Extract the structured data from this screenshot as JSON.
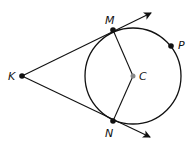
{
  "diagram": {
    "circle": {
      "center": "C",
      "cx": 133,
      "cy": 76,
      "r": 48
    },
    "points": [
      {
        "id": "K",
        "label": "K",
        "x": 22,
        "y": 76,
        "lx": 8,
        "ly": 80
      },
      {
        "id": "M",
        "label": "M",
        "x": 113,
        "y": 30,
        "lx": 105,
        "ly": 24
      },
      {
        "id": "N",
        "label": "N",
        "x": 113,
        "y": 121,
        "lx": 105,
        "ly": 137
      },
      {
        "id": "C",
        "label": "C",
        "x": 133,
        "y": 76,
        "lx": 139,
        "ly": 80
      },
      {
        "id": "P",
        "label": "P",
        "x": 171,
        "y": 46,
        "lx": 178,
        "ly": 49
      }
    ],
    "rays": [
      {
        "from": "K",
        "through": "M",
        "x2": 151,
        "y2": 13
      },
      {
        "from": "K",
        "through": "N",
        "x2": 150,
        "y2": 137
      }
    ],
    "segments": [
      {
        "from": "C",
        "to": "M"
      },
      {
        "from": "C",
        "to": "N"
      }
    ],
    "colors": {
      "stroke": "#111111",
      "center_point": "#888888"
    }
  }
}
